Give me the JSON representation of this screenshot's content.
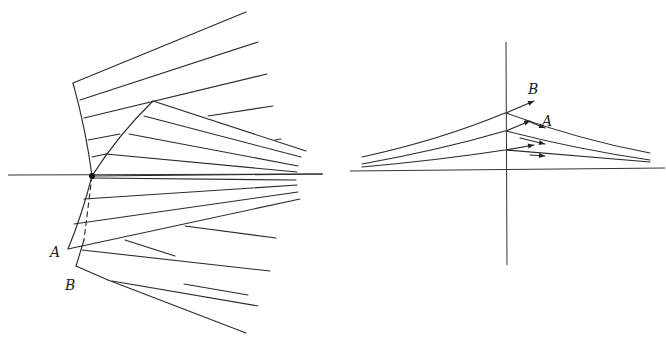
{
  "figure_left": {
    "labels": {
      "A": "A",
      "B": "B"
    },
    "axis": {
      "x1": 8,
      "y1": 175,
      "x2": 323,
      "y2": 174
    },
    "focus_point": {
      "cx": 92,
      "cy": 176,
      "r": 3
    },
    "curve_A_path": "M73,83 Q86,130 92,176 Q82,215 68,249",
    "curve_B_path": "M153,101 Q118,135 92,176",
    "curve_B_dashed_path": "M92,176 L84,240",
    "curve_B_lower_path": "M84,240 L76,266",
    "rays": [
      "M73,83 L246,12",
      "M80,100 L258,42",
      "M84,118 L267,74",
      "M153,101 L306,151",
      "M144,116 L301,157",
      "M129,134 L298,166",
      "M88,140 L120,134",
      "M106,154 L297,172",
      "M92,157 L106,154",
      "M208,116 L273,106",
      "M275,140 L281,139",
      "M92,176 L322,174",
      "M92,178 L296,180",
      "M84,199 L297,185",
      "M74,224 L298,192",
      "M68,249 L300,199",
      "M185,226 L276,238",
      "M82,250 L270,271",
      "M125,240 L175,256",
      "M76,266 L108,280",
      "M112,281 L258,306",
      "M184,284 L248,295",
      "M108,280 L246,333"
    ],
    "label_positions": {
      "A": [
        50,
        257
      ],
      "B": [
        65,
        290
      ]
    }
  },
  "figure_right": {
    "labels": {
      "A": "A",
      "B": "B"
    },
    "vertical_axis": {
      "x1": 506,
      "y1": 42,
      "x2": 507,
      "y2": 265
    },
    "horizontal_axis": {
      "x1": 350,
      "y1": 171,
      "x2": 665,
      "y2": 168
    },
    "curves": [
      "M362,157 Q440,140 505,113",
      "M362,164 Q440,150 505,131",
      "M362,167 Q440,160 505,150",
      "M506,113 Q580,140 650,153",
      "M506,131 Q580,150 650,160",
      "M506,150 Q580,156 650,162"
    ],
    "arrows": [
      {
        "path": "M506,113 L534,101",
        "head": [
          534,
          101
        ]
      },
      {
        "path": "M506,131 L530,121",
        "head": [
          530,
          121
        ]
      },
      {
        "path": "M506,150 L534,145",
        "head": [
          534,
          145
        ]
      },
      {
        "path": "M525,120 L545,128",
        "head": [
          545,
          128
        ]
      },
      {
        "path": "M520,138 L545,144",
        "head": [
          545,
          144
        ]
      },
      {
        "path": "M530,155 L545,156",
        "head": [
          545,
          156
        ]
      }
    ],
    "label_positions": {
      "A": [
        542,
        126
      ],
      "B": [
        528,
        94
      ]
    }
  }
}
